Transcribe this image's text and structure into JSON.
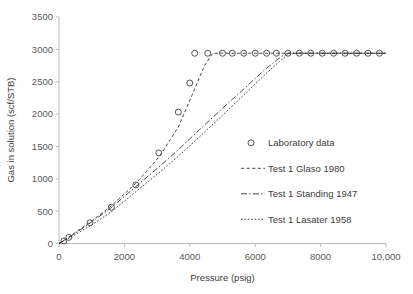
{
  "chart_data": {
    "type": "scatter",
    "title": "",
    "xlabel": "Pressure (psig)",
    "ylabel": "Gas in solution (scf/STB)",
    "xlim": [
      0,
      10000
    ],
    "ylim": [
      0,
      3500
    ],
    "grid": false,
    "legend_position": "inside-right",
    "xticks": [
      0,
      2000,
      4000,
      6000,
      8000,
      10000
    ],
    "xticklabels": [
      "0",
      "2000",
      "4000",
      "6000",
      "8000",
      "10,000"
    ],
    "yticks": [
      0,
      500,
      1000,
      1500,
      2000,
      2500,
      3000,
      3500
    ],
    "yticklabels": [
      "0",
      "500",
      "1000",
      "1500",
      "2000",
      "2500",
      "3000",
      "3500"
    ],
    "saturation_value": 2940,
    "series": [
      {
        "name": "Laboratory data",
        "style": "marker-only",
        "marker": "open-circle",
        "x": [
          150,
          300,
          950,
          1600,
          2350,
          3050,
          3650,
          4000,
          4150,
          4550,
          5000,
          5300,
          5650,
          6000,
          6350,
          6650,
          7000,
          7350,
          7700,
          8050,
          8400,
          8750,
          9100,
          9450,
          9800
        ],
        "y": [
          40,
          95,
          320,
          560,
          905,
          1400,
          2030,
          2480,
          2940,
          2940,
          2940,
          2940,
          2940,
          2940,
          2940,
          2940,
          2940,
          2940,
          2940,
          2940,
          2940,
          2940,
          2940,
          2940,
          2940
        ]
      },
      {
        "name": "Test 1 Glaso 1980",
        "style": "dashed",
        "x": [
          0,
          300,
          950,
          1600,
          2350,
          3050,
          3650,
          4100,
          4450,
          4700,
          5000,
          6000,
          7000,
          8000,
          9000,
          10000
        ],
        "y": [
          0,
          100,
          330,
          580,
          930,
          1330,
          1800,
          2330,
          2750,
          2940,
          2940,
          2940,
          2940,
          2940,
          2940,
          2940
        ]
      },
      {
        "name": "Test 1 Standing 1947",
        "style": "dash-dot",
        "x": [
          0,
          300,
          950,
          1600,
          2350,
          3050,
          3650,
          4300,
          5000,
          5700,
          6300,
          6800,
          7000,
          8000,
          9000,
          10000
        ],
        "y": [
          0,
          95,
          315,
          555,
          880,
          1180,
          1450,
          1760,
          2090,
          2410,
          2690,
          2890,
          2940,
          2940,
          2940,
          2940
        ]
      },
      {
        "name": "Test 1 Lasater 1958",
        "style": "dotted",
        "x": [
          0,
          300,
          950,
          1600,
          2350,
          3050,
          3650,
          4300,
          5000,
          5700,
          6300,
          6800,
          7050,
          8000,
          9000,
          10000
        ],
        "y": [
          0,
          80,
          270,
          490,
          800,
          1090,
          1350,
          1650,
          1980,
          2320,
          2610,
          2840,
          2940,
          2940,
          2940,
          2940
        ]
      }
    ]
  },
  "legend": {
    "items": [
      {
        "label": "Laboratory data",
        "kind": "marker"
      },
      {
        "label": "Test 1 Glaso 1980",
        "kind": "dashed"
      },
      {
        "label": "Test 1 Standing 1947",
        "kind": "dash-dot"
      },
      {
        "label": "Test 1 Lasater 1958",
        "kind": "dotted"
      }
    ]
  },
  "axes": {
    "x_title": "Pressure (psig)",
    "y_title": "Gas in solution (scf/STB)"
  }
}
